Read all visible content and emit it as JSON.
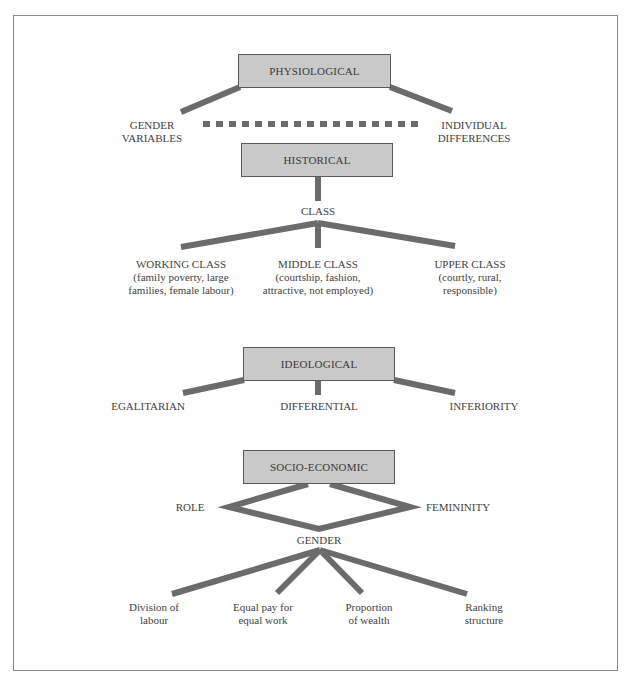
{
  "diagram": {
    "colors": {
      "box_fill": "#c9c9c9",
      "box_border": "#5a5a5a",
      "line": "#6b6b6b",
      "text": "#3a3a3a"
    },
    "physiological": {
      "title": "PHYSIOLOGICAL",
      "left": {
        "line1": "GENDER",
        "line2": "VARIABLES"
      },
      "right": {
        "line1": "INDIVIDUAL",
        "line2": "DIFFERENCES"
      },
      "connector": "dashed"
    },
    "historical": {
      "title": "HISTORICAL",
      "child": "CLASS",
      "classes": [
        {
          "name": "WORKING CLASS",
          "desc1": "(family poverty, large",
          "desc2": "families, female labour)"
        },
        {
          "name": "MIDDLE CLASS",
          "desc1": "(courtship, fashion,",
          "desc2": "attractive, not employed)"
        },
        {
          "name": "UPPER CLASS",
          "desc1": "(courtly, rural,",
          "desc2": "responsible)"
        }
      ]
    },
    "ideological": {
      "title": "IDEOLOGICAL",
      "children": [
        "EGALITARIAN",
        "DIFFERENTIAL",
        "INFERIORITY"
      ]
    },
    "socio_economic": {
      "title": "SOCIO-ECONOMIC",
      "left": "ROLE",
      "right": "FEMININITY",
      "bottom": "GENDER",
      "outcomes": [
        {
          "line1": "Division of",
          "line2": "labour"
        },
        {
          "line1": "Equal pay for",
          "line2": "equal work"
        },
        {
          "line1": "Proportion",
          "line2": "of wealth"
        },
        {
          "line1": "Ranking",
          "line2": "structure"
        }
      ]
    }
  }
}
